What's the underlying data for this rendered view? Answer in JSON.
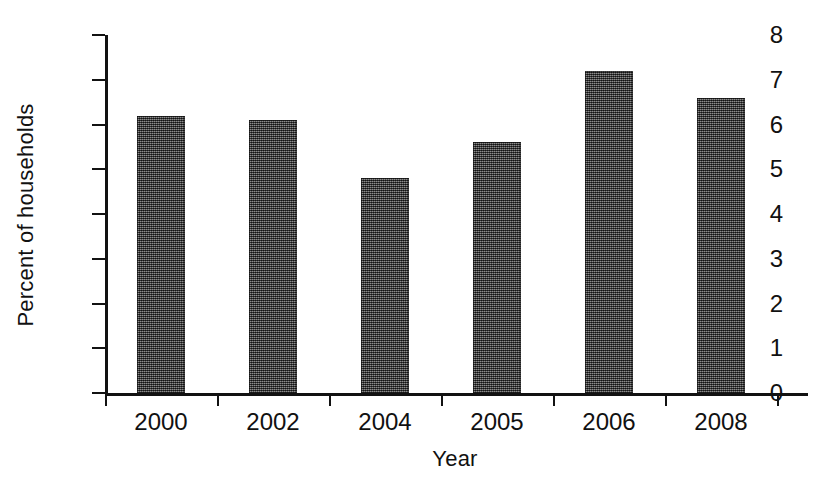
{
  "chart_data": {
    "type": "bar",
    "title": "",
    "categories": [
      "2000",
      "2002",
      "2004",
      "2005",
      "2006",
      "2008"
    ],
    "values": [
      6.2,
      6.1,
      4.8,
      5.6,
      7.2,
      6.6
    ],
    "xlabel": "Year",
    "ylabel": "Percent of households",
    "ylim": [
      0,
      8
    ],
    "ytick_labels": [
      "0",
      "1",
      "2",
      "3",
      "4",
      "5",
      "6",
      "7",
      "8"
    ],
    "ytick_values": [
      0,
      1,
      2,
      3,
      4,
      5,
      6,
      7,
      8
    ],
    "grid": false,
    "legend": false,
    "legend_position": "none",
    "bar_color": "#4e4e4e",
    "axis_color": "#121212",
    "background_color": "#ffffff"
  }
}
